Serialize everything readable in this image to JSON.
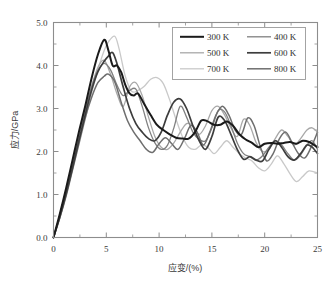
{
  "figure": {
    "background_color": "#ffffff",
    "frame_color": "#8d8d8d"
  },
  "axes": {
    "x": {
      "title": "应变/(%)",
      "min": 0,
      "max": 25,
      "major_ticks": [
        0,
        5,
        10,
        15,
        20,
        25
      ],
      "tick_labels": [
        "0",
        "5",
        "10",
        "15",
        "20",
        "25"
      ],
      "minor_tick_step": 2.5,
      "tick_direction": "in"
    },
    "y": {
      "title": "应力/GPa",
      "min": 0.0,
      "max": 5.0,
      "major_ticks": [
        0.0,
        1.0,
        2.0,
        3.0,
        4.0,
        5.0
      ],
      "tick_labels": [
        "0.0",
        "1.0",
        "2.0",
        "3.0",
        "4.0",
        "5.0"
      ],
      "minor_tick_step": 0.5,
      "tick_direction": "in"
    }
  },
  "legend": {
    "columns": 2,
    "border_color": "#9a9a9a",
    "entries": [
      {
        "label": "300 K",
        "color": "#1a1a1a",
        "width": 2.0
      },
      {
        "label": "400 K",
        "color": "#808080",
        "width": 1.3
      },
      {
        "label": "500 K",
        "color": "#a8a8a8",
        "width": 1.3
      },
      {
        "label": "600 K",
        "color": "#3d3d3d",
        "width": 1.7
      },
      {
        "label": "700 K",
        "color": "#c9c9c9",
        "width": 1.3
      },
      {
        "label": "800 K",
        "color": "#6e6e6e",
        "width": 1.5
      }
    ]
  },
  "chart_data": {
    "type": "line",
    "title": "",
    "xlabel": "应变/(%)",
    "ylabel": "应力/GPa",
    "xlim": [
      0,
      25
    ],
    "ylim": [
      0.0,
      5.0
    ],
    "grid": false,
    "legend_position": "top-right",
    "series": [
      {
        "name": "300 K",
        "color": "#1a1a1a",
        "peak_strain": 4.8,
        "peak_stress": 4.6,
        "x": [
          0,
          0.6,
          1.2,
          1.8,
          2.4,
          3.0,
          3.6,
          4.2,
          4.8,
          5.2,
          5.6,
          6.0,
          6.4,
          6.8,
          7.2,
          7.6,
          8.0,
          8.6,
          9.2,
          9.8,
          10.4,
          11.0,
          11.6,
          12.2,
          12.8,
          13.4,
          14.0,
          14.6,
          15.2,
          15.8,
          16.4,
          17.0,
          17.6,
          18.2,
          18.8,
          19.4,
          20.0,
          20.6,
          21.2,
          21.8,
          22.4,
          23.0,
          23.6,
          24.2,
          25.0
        ],
        "y": [
          0.0,
          0.55,
          1.15,
          1.8,
          2.45,
          3.05,
          3.7,
          4.25,
          4.6,
          4.35,
          4.0,
          4.0,
          3.85,
          3.55,
          3.35,
          3.3,
          3.35,
          3.1,
          2.85,
          2.62,
          2.5,
          2.4,
          2.32,
          2.3,
          2.3,
          2.45,
          2.72,
          2.7,
          2.62,
          2.62,
          2.7,
          2.6,
          2.4,
          2.28,
          2.2,
          2.1,
          2.18,
          2.2,
          2.18,
          2.2,
          2.22,
          2.18,
          2.25,
          2.22,
          2.1
        ]
      },
      {
        "name": "400 K",
        "color": "#808080",
        "peak_strain": 5.0,
        "peak_stress": 4.05,
        "x": [
          0,
          0.6,
          1.2,
          1.8,
          2.4,
          3.0,
          3.6,
          4.2,
          4.8,
          5.4,
          6.0,
          6.6,
          7.2,
          7.8,
          8.4,
          9.0,
          9.6,
          10.2,
          10.8,
          11.4,
          12.0,
          12.6,
          13.2,
          13.8,
          14.4,
          15.0,
          15.6,
          16.2,
          16.8,
          17.4,
          18.0,
          18.6,
          19.2,
          19.8,
          20.4,
          21.0,
          21.6,
          22.2,
          22.8,
          23.4,
          24.0,
          24.5,
          25.0
        ],
        "y": [
          0.0,
          0.52,
          1.1,
          1.72,
          2.35,
          2.95,
          3.5,
          3.88,
          4.05,
          3.9,
          3.55,
          3.3,
          3.42,
          3.45,
          3.05,
          2.55,
          2.2,
          2.05,
          2.15,
          2.55,
          3.05,
          2.8,
          2.45,
          2.28,
          2.25,
          2.55,
          2.95,
          2.92,
          2.6,
          2.2,
          1.95,
          1.88,
          1.8,
          1.9,
          2.1,
          2.25,
          2.15,
          1.95,
          1.8,
          1.92,
          2.15,
          2.25,
          2.05
        ]
      },
      {
        "name": "500 K",
        "color": "#a8a8a8",
        "peak_strain": 4.8,
        "peak_stress": 4.12,
        "x": [
          0,
          0.6,
          1.2,
          1.8,
          2.4,
          3.0,
          3.6,
          4.2,
          4.8,
          5.4,
          6.0,
          6.6,
          7.2,
          7.8,
          8.4,
          9.0,
          9.6,
          10.2,
          10.8,
          11.4,
          12.0,
          12.6,
          13.2,
          13.8,
          14.4,
          15.0,
          15.6,
          16.2,
          16.8,
          17.4,
          18.0,
          18.6,
          19.2,
          19.8,
          20.4,
          21.0,
          21.6,
          22.2,
          22.8,
          23.4,
          24.0,
          24.5,
          25.0
        ],
        "y": [
          0.0,
          0.5,
          1.05,
          1.68,
          2.3,
          2.92,
          3.5,
          3.95,
          4.12,
          3.8,
          3.35,
          3.05,
          3.5,
          3.6,
          3.3,
          2.8,
          2.35,
          2.1,
          2.05,
          2.2,
          2.45,
          2.65,
          2.6,
          2.4,
          2.6,
          2.95,
          3.05,
          2.85,
          2.55,
          2.35,
          2.75,
          2.6,
          2.2,
          2.0,
          2.05,
          2.3,
          2.5,
          2.35,
          2.15,
          2.3,
          2.5,
          2.55,
          2.45
        ]
      },
      {
        "name": "600 K",
        "color": "#3d3d3d",
        "peak_strain": 5.6,
        "peak_stress": 4.3,
        "x": [
          0,
          0.6,
          1.2,
          1.8,
          2.4,
          3.0,
          3.6,
          4.2,
          4.8,
          5.2,
          5.6,
          6.0,
          6.6,
          7.2,
          7.8,
          8.4,
          9.0,
          9.6,
          10.2,
          10.8,
          11.4,
          12.0,
          12.6,
          13.2,
          13.8,
          14.4,
          15.0,
          15.6,
          16.2,
          16.8,
          17.4,
          18.0,
          18.6,
          19.2,
          19.8,
          20.4,
          21.0,
          21.6,
          22.2,
          22.8,
          23.4,
          24.0,
          24.5,
          25.0
        ],
        "y": [
          0.0,
          0.48,
          1.02,
          1.62,
          2.25,
          2.85,
          3.42,
          3.85,
          4.1,
          4.22,
          4.3,
          4.05,
          3.5,
          3.0,
          2.65,
          2.45,
          2.3,
          2.25,
          2.45,
          2.85,
          3.15,
          3.22,
          3.0,
          2.6,
          2.25,
          2.05,
          2.35,
          2.8,
          2.72,
          2.4,
          2.05,
          1.82,
          1.88,
          1.8,
          1.78,
          2.05,
          2.25,
          2.1,
          1.88,
          1.8,
          1.95,
          2.15,
          2.1,
          1.95
        ]
      },
      {
        "name": "700 K",
        "color": "#c9c9c9",
        "peak_strain": 5.8,
        "peak_stress": 4.68,
        "x": [
          0,
          0.6,
          1.2,
          1.8,
          2.4,
          3.0,
          3.6,
          4.2,
          4.8,
          5.2,
          5.8,
          6.2,
          6.8,
          7.4,
          8.0,
          8.6,
          9.2,
          9.8,
          10.4,
          11.0,
          11.6,
          12.2,
          12.8,
          13.4,
          14.0,
          14.6,
          15.2,
          15.8,
          16.4,
          17.0,
          17.6,
          18.2,
          18.8,
          19.4,
          20.0,
          20.6,
          21.2,
          21.8,
          22.4,
          23.0,
          23.6,
          24.2,
          25.0
        ],
        "y": [
          0.0,
          0.45,
          0.95,
          1.55,
          2.15,
          2.75,
          3.35,
          3.9,
          4.35,
          4.55,
          4.68,
          4.4,
          3.75,
          3.4,
          3.42,
          3.52,
          3.68,
          3.72,
          3.58,
          3.2,
          2.75,
          2.35,
          2.1,
          2.05,
          2.15,
          2.1,
          1.95,
          2.1,
          2.25,
          2.1,
          1.95,
          1.85,
          1.78,
          1.62,
          1.55,
          1.7,
          1.9,
          1.72,
          1.48,
          1.3,
          1.42,
          1.55,
          1.5
        ]
      },
      {
        "name": "800 K",
        "color": "#6e6e6e",
        "peak_strain": 5.2,
        "peak_stress": 3.8,
        "x": [
          0,
          0.6,
          1.2,
          1.8,
          2.4,
          3.0,
          3.6,
          4.2,
          4.8,
          5.2,
          5.8,
          6.4,
          7.0,
          7.6,
          8.2,
          8.8,
          9.4,
          10.0,
          10.6,
          11.2,
          11.8,
          12.4,
          13.0,
          13.6,
          14.2,
          14.8,
          15.4,
          16.0,
          16.6,
          17.2,
          17.8,
          18.4,
          19.0,
          19.6,
          20.2,
          20.8,
          21.4,
          22.0,
          22.6,
          23.2,
          23.8,
          24.4,
          25.0
        ],
        "y": [
          0.0,
          0.46,
          0.98,
          1.58,
          2.18,
          2.78,
          3.25,
          3.6,
          3.75,
          3.8,
          3.62,
          3.15,
          2.72,
          2.45,
          2.25,
          2.05,
          1.98,
          2.18,
          2.32,
          2.18,
          2.05,
          2.3,
          2.6,
          2.45,
          2.15,
          2.45,
          2.85,
          3.05,
          2.85,
          2.5,
          2.4,
          2.78,
          2.6,
          2.1,
          1.78,
          1.95,
          2.3,
          2.45,
          2.2,
          1.95,
          1.85,
          2.1,
          2.45
        ]
      }
    ]
  }
}
